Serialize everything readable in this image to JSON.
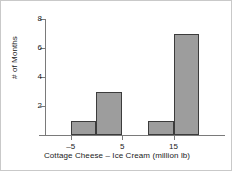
{
  "chart_data": {
    "type": "bar",
    "title": "",
    "xlabel": "Cottage Cheese – Ice Cream (million lb)",
    "ylabel": "# of Months",
    "xlim": [
      -10,
      25
    ],
    "ylim": [
      0,
      8
    ],
    "grid": false,
    "legend": null,
    "bin_width": 5,
    "categories": [
      "-10 to -5",
      "-5 to 0",
      "0 to 5",
      "5 to 10",
      "10 to 15",
      "15 to 20"
    ],
    "bin_starts": [
      -10,
      -5,
      0,
      5,
      10,
      15
    ],
    "bin_ends": [
      -5,
      0,
      5,
      10,
      15,
      20
    ],
    "values": [
      0,
      1,
      3,
      0,
      1,
      7
    ],
    "bars": [
      {
        "label": "-5 to 0",
        "start": -5,
        "end": 0,
        "value": 1
      },
      {
        "label": "0 to 5",
        "start": 0,
        "end": 5,
        "value": 3
      },
      {
        "label": "10 to 15",
        "start": 10,
        "end": 15,
        "value": 1
      },
      {
        "label": "15 to 20",
        "start": 15,
        "end": 20,
        "value": 7
      }
    ],
    "xticks": [
      {
        "value": -5,
        "label": "–5"
      },
      {
        "value": 5,
        "label": "5"
      },
      {
        "value": 15,
        "label": "15"
      }
    ],
    "yticks": [
      {
        "value": 2,
        "label": "2"
      },
      {
        "value": 4,
        "label": "4"
      },
      {
        "value": 6,
        "label": "6"
      },
      {
        "value": 8,
        "label": "8"
      }
    ],
    "colors": {
      "bar_fill": "#9d9d9d",
      "bar_edge": "#3c3c3c",
      "axis": "#7a7a7a",
      "text": "#1a1a1a",
      "background": "#ffffff"
    }
  }
}
